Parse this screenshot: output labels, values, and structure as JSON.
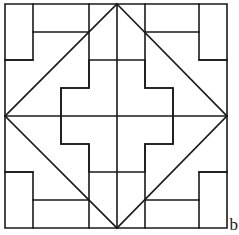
{
  "figure": {
    "colors": {
      "background": "#ffffff",
      "stroke": "#1a1a1a"
    },
    "stroke_width": 1.6,
    "geometry": {
      "border": {
        "left": 5,
        "top": 4,
        "right": 227,
        "bottom": 228
      },
      "grid_unit": 28,
      "grid_x": [
        5,
        33,
        61,
        89,
        117,
        145,
        173,
        199,
        227
      ],
      "grid_y": [
        4,
        32,
        60,
        88,
        116,
        144,
        172,
        200,
        228
      ],
      "center": {
        "x": 117,
        "y": 116
      }
    },
    "paths": {
      "outer_border": "M5,4 L227,4 L227,228 L5,228 Z",
      "center_vertical": "M117,4 L117,228",
      "center_horizontal": "M5,116 L227,116",
      "diagonal_top_left": "M117,4 L5,116",
      "diagonal_top_right": "M117,4 L227,116",
      "diagonal_bottom_left": "M5,116 L117,228",
      "diagonal_bottom_right": "M227,116 L117,228",
      "center_cross": "M89,60 L145,60 L145,88 L173,88 L173,144 L145,144 L145,172 L89,172 L89,144 L61,144 L61,88 L89,88 Z",
      "step_top_left": "M5,60 L33,60 L33,32 L89,32 L89,88 L61,88 L61,116",
      "step_top_right": "M227,60 L199,60 L199,32 L145,32 L145,88 L173,88 L173,116",
      "step_bottom_left": "M5,172 L33,172 L33,200 L89,200 L89,144 L61,144 L61,116",
      "step_bottom_right": "M227,172 L199,172 L199,200 L145,200 L145,144 L173,144 L173,116",
      "tick_top_left": "M33,4 L33,32",
      "tick_top_right": "M199,4 L199,32",
      "tick_bottom_left": "M33,228 L33,200",
      "tick_bottom_right": "M199,228 L199,200",
      "tick_left_upper": "M5,60 L5,60",
      "spur_top_left": "M89,32 L89,4",
      "spur_top_right": "M145,32 L145,4",
      "spur_bottom_left": "M89,200 L89,228",
      "spur_bottom_right": "M145,200 L145,228",
      "spur_left_upper": "M5,60 L33,60",
      "spur_right_upper": "M199,60 L227,60",
      "spur_left_lower": "M5,172 L33,172",
      "spur_right_lower": "M199,172 L227,172"
    }
  },
  "artifacts": {
    "edge_letter": "b"
  }
}
